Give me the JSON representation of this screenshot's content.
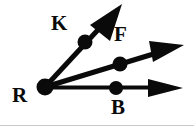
{
  "figure": {
    "width": 194,
    "height": 130,
    "background_color": "#ffffff",
    "stroke_color": "#0a0a0a",
    "baseline_color": "#c9c9c9"
  },
  "labels": {
    "vertex": "R",
    "upper_ray_point": "K",
    "middle_ray_point": "F",
    "lower_ray_point": "B"
  },
  "geometry": {
    "vertex": {
      "name": "R",
      "x": 45,
      "y": 87,
      "dot_radius": 8
    },
    "rays": [
      {
        "name": "ray-RK",
        "label": "K",
        "point": {
          "x": 85,
          "y": 42,
          "dot_radius": 7
        },
        "tip": {
          "x": 122,
          "y": 6
        },
        "thickness": 5,
        "label_position": {
          "x": 51,
          "y": 13
        }
      },
      {
        "name": "ray-RF",
        "label": "F",
        "point": {
          "x": 120,
          "y": 64,
          "dot_radius": 7
        },
        "tip": {
          "x": 184,
          "y": 45
        },
        "thickness": 5,
        "label_position": {
          "x": 113,
          "y": 24
        }
      },
      {
        "name": "ray-RB",
        "label": "B",
        "point": {
          "x": 116,
          "y": 88,
          "dot_radius": 7
        },
        "tip": {
          "x": 184,
          "y": 88
        },
        "thickness": 4,
        "label_position": {
          "x": 110,
          "y": 97
        }
      }
    ],
    "baseline_rule": {
      "y": 125
    }
  }
}
